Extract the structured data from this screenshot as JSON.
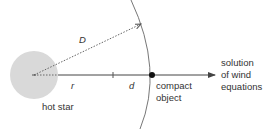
{
  "diagram": {
    "labels": {
      "distance_D": "D",
      "radius_r": "r",
      "distance_d": "d",
      "hot_star": "hot star",
      "compact_object_line1": "compact",
      "compact_object_line2": "object",
      "solution_line1": "solution",
      "solution_line2": "of wind",
      "solution_line3": "equations"
    },
    "colors": {
      "star_fill": "#d9d9d9",
      "line": "#444444",
      "dashed": "#666666",
      "arc": "#777777",
      "dot": "#111111"
    },
    "elements": [
      "hot star (gray disc)",
      "dashed line D from star center to arc",
      "horizontal axis r from star to compact object with tick",
      "segment d ending at compact object",
      "compact object (black dot)",
      "arc of radius D through compact object",
      "arrow pointing to solution of wind equations"
    ]
  }
}
